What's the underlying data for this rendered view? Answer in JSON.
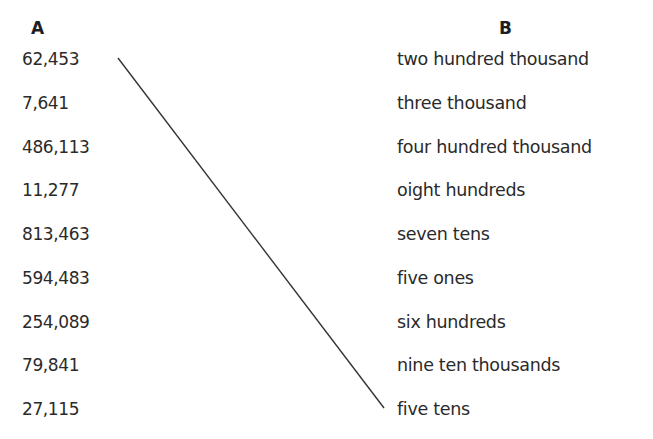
{
  "headers": {
    "a": "A",
    "b": "B"
  },
  "column_a": [
    "62,453",
    "7,641",
    "486,113",
    "11,277",
    "813,463",
    "594,483",
    "254,089",
    "79,841",
    "27,115"
  ],
  "column_b": [
    "two hundred thousand",
    "three thousand",
    "four hundred thousand",
    "oight hundreds",
    "seven tens",
    "five ones",
    "six hundreds",
    "nine ten thousands",
    "five tens"
  ],
  "connections": [
    {
      "from": "62,453",
      "to": "five tens",
      "x1": 118,
      "y1": 58,
      "x2": 384,
      "y2": 408,
      "color": "#333333"
    }
  ]
}
